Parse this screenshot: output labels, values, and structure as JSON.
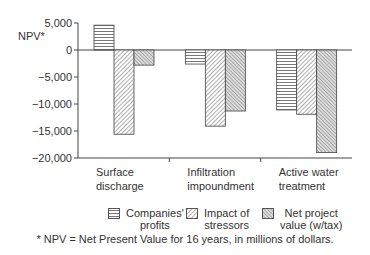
{
  "chart_data": {
    "type": "bar",
    "title": "",
    "xlabel": "",
    "ylabel": "NPV*",
    "ylim": [
      -20000,
      5000
    ],
    "yticks": [
      5000,
      0,
      -5000,
      -10000,
      -15000,
      -20000
    ],
    "ytick_labels": [
      "5,000",
      "0",
      "-5,000",
      "-10,000",
      "-15,000",
      "-20,000"
    ],
    "grid": false,
    "legend_position": "bottom",
    "categories": [
      [
        "Surface",
        "discharge"
      ],
      [
        "Infiltration",
        "impoundment"
      ],
      [
        "Active water",
        "treatment"
      ]
    ],
    "category_labels": [
      "Surface discharge",
      "Infiltration impoundment",
      "Active water treatment"
    ],
    "series": [
      {
        "name": "Companies' profits",
        "pattern": "horizontal-lines",
        "values": [
          4600,
          -2600,
          -11100
        ]
      },
      {
        "name": "Impact of stressors",
        "pattern": "diagonal-lines",
        "values": [
          -15600,
          -14100,
          -11900
        ]
      },
      {
        "name": "Net project value (w/tax)",
        "pattern": "dense-diagonal-lines",
        "values": [
          -2800,
          -11300,
          -19000
        ]
      }
    ],
    "footnote": "* NPV = Net Present Value for 16 years, in millions of dollars."
  },
  "legend": {
    "items": [
      {
        "line1": "Companies'",
        "line2": "profits"
      },
      {
        "line1": "Impact of",
        "line2": "stressors"
      },
      {
        "line1": "Net project",
        "line2": "value (w/tax)"
      }
    ]
  },
  "axis": {
    "ylabel": "NPV*"
  },
  "footnote": "* NPV = Net Present Value for 16 years, in millions of dollars.",
  "colors": {
    "axis": "#444444",
    "bar_border": "#444444",
    "pattern": "#666666",
    "text": "#333333"
  }
}
